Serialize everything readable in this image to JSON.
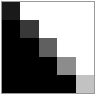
{
  "figure": {
    "title": "",
    "background_color": "#ffffff",
    "frame_color": "#9a9a9a",
    "width_px": 96,
    "height_px": 95
  },
  "chart_data": {
    "type": "heatmap",
    "title": "",
    "subtitle": "",
    "xlabel": "",
    "ylabel": "",
    "grid": false,
    "legend": "none",
    "x": [
      1,
      2,
      3,
      4,
      5
    ],
    "categories": [
      "1",
      "2",
      "3",
      "4",
      "5"
    ],
    "row_labels": [
      "1",
      "2",
      "3",
      "4",
      "5"
    ],
    "column_labels": [
      "1",
      "2",
      "3",
      "4",
      "5"
    ],
    "xtick_labels": [],
    "ytick_labels": [],
    "annotations": [],
    "colormap": "grayscale",
    "value_range": [
      0,
      1
    ],
    "values": [
      [
        0.1,
        1.0,
        1.0,
        1.0,
        1.0
      ],
      [
        0.0,
        0.22,
        1.0,
        1.0,
        1.0
      ],
      [
        0.0,
        0.0,
        0.38,
        1.0,
        1.0
      ],
      [
        0.0,
        0.0,
        0.0,
        0.56,
        1.0
      ],
      [
        0.0,
        0.0,
        0.0,
        0.0,
        0.76
      ]
    ],
    "cell_colors": [
      [
        "#1a1a1a",
        "#ffffff",
        "#ffffff",
        "#ffffff",
        "#ffffff"
      ],
      [
        "#000000",
        "#383838",
        "#ffffff",
        "#ffffff",
        "#ffffff"
      ],
      [
        "#000000",
        "#000000",
        "#606060",
        "#ffffff",
        "#ffffff"
      ],
      [
        "#000000",
        "#000000",
        "#000000",
        "#8c8c8c",
        "#ffffff"
      ],
      [
        "#000000",
        "#000000",
        "#000000",
        "#000000",
        "#c2c2c2"
      ]
    ]
  }
}
